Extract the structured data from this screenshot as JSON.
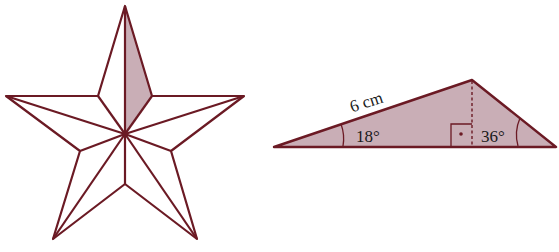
{
  "figure": {
    "colors": {
      "stroke": "#6b1a24",
      "fill": "#c9aeb6",
      "background": "#ffffff"
    },
    "star": {
      "points": 5,
      "shaded_section": "top-right half of top arm"
    },
    "triangle": {
      "side_label": "6 cm",
      "angle_left": "18°",
      "angle_right": "36°",
      "right_angle_marker": "right-angle-with-dot",
      "altitude": "dashed"
    }
  }
}
